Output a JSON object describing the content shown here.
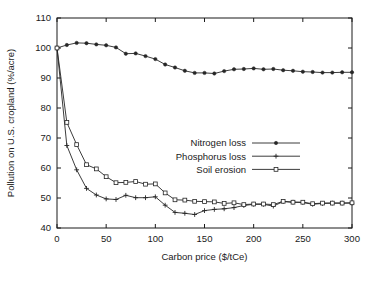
{
  "chart_data": {
    "type": "line",
    "title": "",
    "xlabel": "Carbon price ($/tCe)",
    "ylabel": "Pollution on U.S. cropland (%/acre)",
    "xlim": [
      0,
      300
    ],
    "ylim": [
      40,
      110
    ],
    "xticks": [
      0,
      50,
      100,
      150,
      200,
      250,
      300
    ],
    "yticks": [
      40,
      50,
      60,
      70,
      80,
      90,
      100,
      110
    ],
    "xtick_labels": [
      "0",
      "50",
      "100",
      "150",
      "200",
      "250",
      "300"
    ],
    "ytick_labels": [
      "40",
      "50",
      "60",
      "70",
      "80",
      "90",
      "100",
      "110"
    ],
    "grid": false,
    "legend_position": "center-right",
    "x": [
      0,
      10,
      20,
      30,
      40,
      50,
      60,
      70,
      80,
      90,
      100,
      110,
      120,
      130,
      140,
      150,
      160,
      170,
      180,
      190,
      200,
      210,
      220,
      230,
      240,
      250,
      260,
      270,
      280,
      290,
      300
    ],
    "series": [
      {
        "name": "Nitrogen loss",
        "marker": "dot",
        "values": [
          100.0,
          101.0,
          101.7,
          101.6,
          101.2,
          100.9,
          100.2,
          98.1,
          98.2,
          97.3,
          96.3,
          94.5,
          93.5,
          92.4,
          91.7,
          91.7,
          91.5,
          92.3,
          92.9,
          93.0,
          93.2,
          92.9,
          93.0,
          92.6,
          92.4,
          92.1,
          92.0,
          91.8,
          91.8,
          91.9,
          91.9
        ]
      },
      {
        "name": "Phosphorus loss",
        "marker": "plus",
        "values": [
          100.0,
          67.5,
          59.4,
          53.2,
          51.0,
          49.7,
          49.5,
          50.9,
          50.1,
          50.1,
          50.4,
          47.6,
          45.2,
          44.9,
          44.5,
          45.8,
          46.2,
          46.4,
          46.8,
          47.5,
          47.9,
          47.9,
          47.3,
          48.8,
          48.6,
          48.5,
          47.9,
          48.2,
          48.3,
          48.3,
          48.3
        ]
      },
      {
        "name": "Soil erosion",
        "marker": "square",
        "values": [
          100.0,
          75.2,
          67.8,
          61.1,
          59.7,
          57.1,
          55.1,
          55.2,
          55.5,
          54.6,
          54.7,
          51.7,
          49.4,
          49.3,
          48.9,
          48.8,
          48.7,
          48.2,
          48.4,
          47.8,
          48.0,
          48.0,
          47.8,
          48.9,
          48.6,
          48.6,
          48.1,
          48.3,
          48.3,
          48.3,
          48.4
        ]
      }
    ]
  },
  "legend": {
    "items": [
      {
        "label": "Nitrogen loss",
        "marker": "dot-marker"
      },
      {
        "label": "Phosphorus loss",
        "marker": "plus-marker"
      },
      {
        "label": "Soil erosion",
        "marker": "square-marker"
      }
    ]
  },
  "colors": {
    "ink": "#262626",
    "axis": "#1a1a1a",
    "background": "#ffffff"
  }
}
